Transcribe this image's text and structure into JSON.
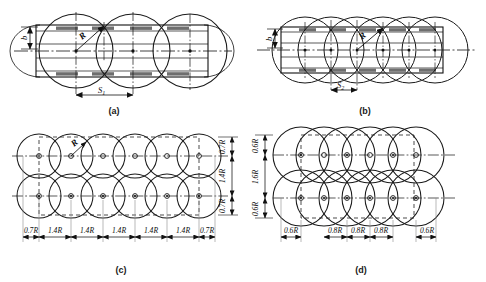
{
  "figure": {
    "panels": [
      {
        "id": "a",
        "caption": "(a)",
        "type": "single-row-wide-spacing",
        "circle_count": 3,
        "rows": 1,
        "radius_label": "R",
        "width_label": "b",
        "spacing_label": "S",
        "spacing_subscript": "1",
        "strip": true
      },
      {
        "id": "b",
        "caption": "(b)",
        "type": "single-row-tight-spacing",
        "circle_count": 6,
        "rows": 1,
        "radius_label": "R",
        "width_label": "b",
        "spacing_label": "S",
        "spacing_subscript": "2",
        "strip": true
      },
      {
        "id": "c",
        "caption": "(c)",
        "type": "two-row-grid",
        "circle_count": 12,
        "rows": 2,
        "columns": 6,
        "radius_label": "R",
        "horizontal_dims": [
          "0.7R",
          "1.4R",
          "1.4R",
          "1.4R",
          "1.4R",
          "1.4R",
          "0.7R"
        ],
        "vertical_dims": [
          "0.7R",
          "1.4R",
          "0.7R"
        ]
      },
      {
        "id": "d",
        "caption": "(d)",
        "type": "two-row-dense-grid",
        "circle_count": 12,
        "rows": 2,
        "columns": 6,
        "radius_label": "R",
        "horizontal_dims": [
          "0.6R",
          "0.8R",
          "0.8R",
          "0.8R",
          "0.6R"
        ],
        "vertical_dims": [
          "0.6R",
          "1.6R",
          "0.6R"
        ]
      }
    ],
    "colors": {
      "line": "#111111",
      "circle": "#1a1a1a",
      "dashed": "#2b2b2b",
      "fill_band": "#6e6e6e",
      "background": "#ffffff"
    }
  }
}
